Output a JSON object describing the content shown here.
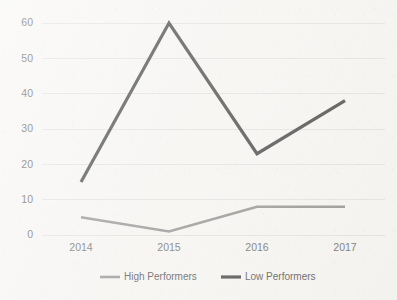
{
  "chart_data": {
    "type": "line",
    "title": "",
    "subtitle": "",
    "xlabel": "",
    "ylabel": "",
    "categories": [
      "2014",
      "2015",
      "2016",
      "2017"
    ],
    "series": [
      {
        "name": "High Performers",
        "values": [
          5,
          1,
          8,
          8
        ],
        "color": "#7a7a7a",
        "stroke_width": 2.6
      },
      {
        "name": "Low Performers",
        "values": [
          15,
          60,
          23,
          38
        ],
        "color": "#1c1c1c",
        "stroke_width": 3.2
      }
    ],
    "ylim": [
      0,
      60
    ],
    "yticks": [
      0,
      10,
      20,
      30,
      40,
      50,
      60
    ],
    "ytick_labels": [
      "0",
      "10",
      "20",
      "30",
      "40",
      "50",
      "60"
    ],
    "grid": true,
    "grid_axis": "y",
    "grid_color": "#dfdedb",
    "legend_position": "bottom",
    "background_color": "#f7f6f3",
    "axis_label_color": "#4a4a4a"
  },
  "legend": {
    "items": [
      {
        "label": "High Performers",
        "color": "#7a7a7a"
      },
      {
        "label": "Low Performers",
        "color": "#1c1c1c"
      }
    ]
  }
}
